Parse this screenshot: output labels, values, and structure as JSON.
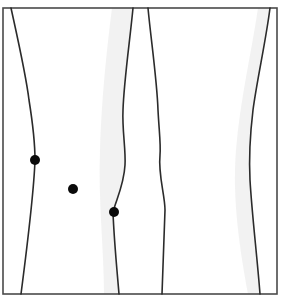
{
  "diagram": {
    "type": "knee-outline-anterior-view",
    "colors": {
      "background": "#ffffff",
      "frame": "#4a4a4a",
      "contour": "#2b2b2b",
      "marker": "#0a0a0a",
      "shading": "#ececec"
    },
    "frame": {
      "x": 3,
      "y": 8,
      "width": 274,
      "height": 286
    },
    "legs": [
      {
        "name": "left-leg",
        "outer_contour": "M11,8 C18,40 26,75 29,100 C33,125 35,145 35,160 C34,190 28,240 21,294",
        "inner_contour": "M133,8 C130,40 124,80 123,110 C122,130 126,150 125,165 C124,185 116,200 113,212 C114,240 117,270 119,294",
        "shading": "M112,8 L133,8 C130,40 124,80 123,110 C122,130 126,150 125,165 C124,185 116,200 113,212 C114,240 117,270 119,294 L104,294 C104,250 98,200 100,150 C102,90 108,40 112,8 Z"
      },
      {
        "name": "right-leg",
        "inner_contour": "M148,8 C151,40 157,80 158,110 C159,130 161,145 160,155 C158,175 165,195 165,210 C164,240 163,270 162,294",
        "outer_contour": "M270,8 C266,40 257,80 253,110 C250,135 249,160 250,180 C252,215 257,255 260,294",
        "shading": "M270,8 C266,40 257,80 253,110 C250,135 249,160 250,180 C252,215 257,255 260,294 L248,294 C240,250 232,200 236,150 C240,100 252,50 258,8 Z"
      }
    ],
    "markers": [
      {
        "name": "marker-medial-joint-line",
        "cx": 35,
        "cy": 160,
        "r": 5
      },
      {
        "name": "marker-center",
        "cx": 73,
        "cy": 189,
        "r": 5
      },
      {
        "name": "marker-lateral-joint-line",
        "cx": 114,
        "cy": 212,
        "r": 5
      }
    ]
  }
}
